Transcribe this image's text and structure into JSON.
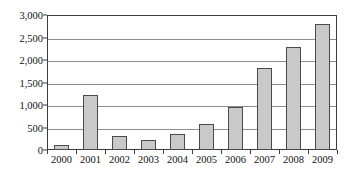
{
  "chart_data": {
    "type": "bar",
    "title": "",
    "subtitle": "",
    "xlabel": "",
    "ylabel": "",
    "categories": [
      "2000",
      "2001",
      "2002",
      "2003",
      "2004",
      "2005",
      "2006",
      "2007",
      "2008",
      "2009"
    ],
    "values": [
      110,
      1230,
      320,
      220,
      350,
      580,
      960,
      1830,
      2300,
      2810
    ],
    "series": [
      {
        "name": "",
        "values": [
          110,
          1230,
          320,
          220,
          350,
          580,
          960,
          1830,
          2300,
          2810
        ]
      }
    ],
    "ylim": [
      0,
      3000
    ],
    "ytick_values": [
      0,
      500,
      1000,
      1500,
      2000,
      2500,
      3000
    ],
    "ytick_labels": [
      "0",
      "500",
      "1,000",
      "1,500",
      "2,000",
      "2,500",
      "3,000"
    ],
    "xtick_labels": [
      "2000",
      "2001",
      "2002",
      "2003",
      "2004",
      "2005",
      "2006",
      "2007",
      "2008",
      "2009"
    ],
    "grid": "horizontal",
    "legend": "none",
    "annotations": [],
    "colors": {
      "bar_fill": "#c9c9c9",
      "bar_stroke": "#4a4a4a",
      "gridline": "#8d8d8d",
      "axis": "#3c3c3c",
      "text": "#111111",
      "background": "#ffffff"
    }
  }
}
